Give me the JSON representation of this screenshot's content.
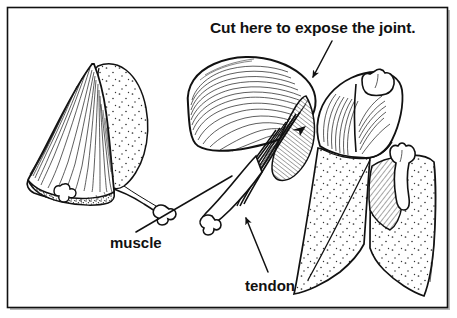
{
  "figure": {
    "domain_kind": "anatomical-line-drawing",
    "border_color": "#111111",
    "ink_color": "#111111",
    "background_color": "#ffffff",
    "shadow_color": "#b9b9b9",
    "annotations": {
      "title_callout": {
        "text": "Cut here to expose the joint.",
        "name": "cut-here-callout",
        "arrow": "down-left, solid head"
      },
      "muscle_callout": {
        "text": "muscle",
        "name": "muscle-callout",
        "arrow": "plain leader line, up-right"
      },
      "tendon_callout": {
        "text": "tendon",
        "name": "tendon-callout",
        "arrow": "up-left, solid head"
      }
    },
    "panels": [
      {
        "name": "panel-left-skin-removed",
        "description": "Limb with skin flap peeled back and a cut cross-section showing bone"
      },
      {
        "name": "panel-middle-muscle-tendon",
        "description": "Exposed muscle belly tapering into tendons attached to bone"
      },
      {
        "name": "panel-right-joint-exposed",
        "description": "Two limb sections separated at the joint with bone ends exposed"
      }
    ]
  }
}
